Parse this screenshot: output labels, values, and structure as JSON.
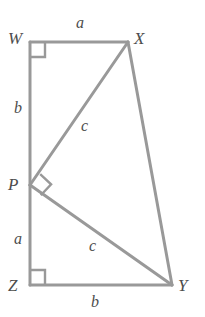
{
  "figure": {
    "stroke_color": "#999999",
    "label_color": "#4d4d4d",
    "background_color": "#ffffff",
    "stroke_width": 3
  },
  "vertices": [
    {
      "name": "W",
      "label": "W",
      "x": 30,
      "y": 42,
      "label_x": 8,
      "label_y": 30
    },
    {
      "name": "X",
      "label": "X",
      "x": 128,
      "y": 42,
      "label_x": 134,
      "label_y": 30
    },
    {
      "name": "P",
      "label": "P",
      "x": 30,
      "y": 185,
      "label_x": 8,
      "label_y": 176
    },
    {
      "name": "Z",
      "label": "Z",
      "x": 30,
      "y": 285,
      "label_x": 8,
      "label_y": 277
    },
    {
      "name": "Y",
      "label": "Y",
      "x": 172,
      "y": 285,
      "label_x": 178,
      "label_y": 277
    }
  ],
  "segments": [
    {
      "name": "segment-WX",
      "from": "W",
      "to": "X",
      "label": "a"
    },
    {
      "name": "segment-WP",
      "from": "W",
      "to": "P",
      "label": "b"
    },
    {
      "name": "segment-PZ",
      "from": "P",
      "to": "Z",
      "label": "a"
    },
    {
      "name": "segment-ZY",
      "from": "Z",
      "to": "Y",
      "label": "b"
    },
    {
      "name": "segment-XY",
      "from": "X",
      "to": "Y",
      "label": ""
    },
    {
      "name": "segment-PX",
      "from": "P",
      "to": "X",
      "label": "c"
    },
    {
      "name": "segment-PY",
      "from": "P",
      "to": "Y",
      "label": "c"
    }
  ],
  "side_labels": [
    {
      "name": "side-label-a-top",
      "text": "a",
      "x": 76,
      "y": 15
    },
    {
      "name": "side-label-b-left",
      "text": "b",
      "x": 14,
      "y": 100
    },
    {
      "name": "side-label-a-left",
      "text": "a",
      "x": 14,
      "y": 231
    },
    {
      "name": "side-label-b-bottom",
      "text": "b",
      "x": 91,
      "y": 294
    },
    {
      "name": "side-label-c-upper",
      "text": "c",
      "x": 81,
      "y": 118
    },
    {
      "name": "side-label-c-lower",
      "text": "c",
      "x": 89,
      "y": 238
    }
  ],
  "right_angles": [
    {
      "name": "right-angle-W",
      "at": "W",
      "size": 15
    },
    {
      "name": "right-angle-Z",
      "at": "Z",
      "size": 15
    },
    {
      "name": "right-angle-P",
      "at": "P",
      "size": 15
    }
  ]
}
